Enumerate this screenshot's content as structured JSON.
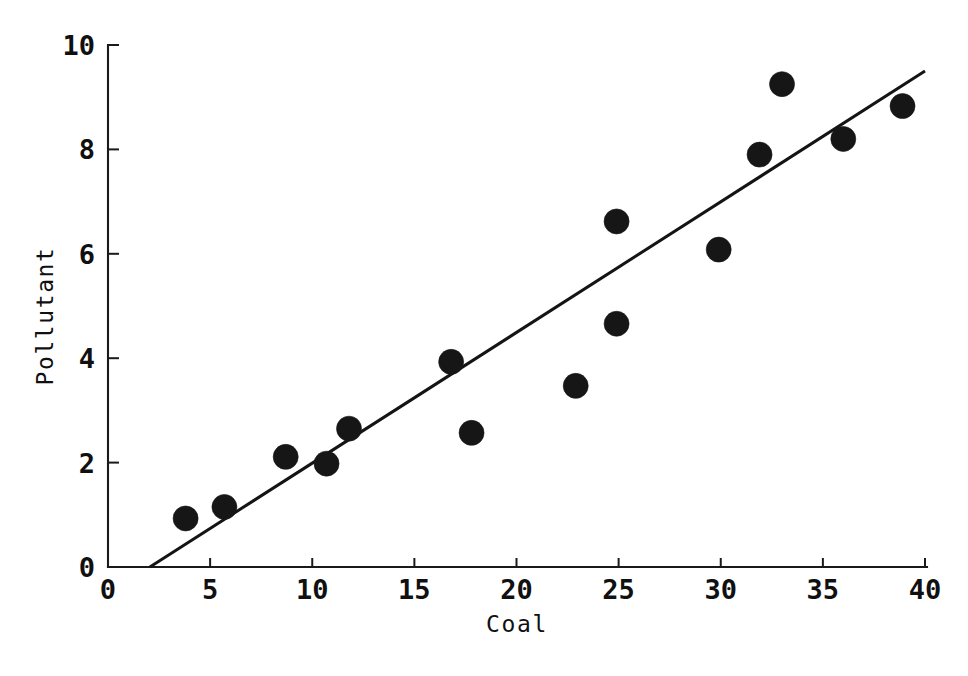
{
  "chart_data": {
    "type": "scatter",
    "title": "",
    "xlabel": "Coal",
    "ylabel": "Pollutant",
    "xlim": [
      0,
      40
    ],
    "ylim": [
      0,
      10
    ],
    "xticks": [
      "0",
      "5",
      "10",
      "15",
      "20",
      "25",
      "30",
      "35",
      "40"
    ],
    "xtick_values": [
      0,
      5,
      10,
      15,
      20,
      25,
      30,
      35,
      40
    ],
    "yticks": [
      "0",
      "2",
      "4",
      "6",
      "8",
      "10"
    ],
    "ytick_values": [
      0,
      2,
      4,
      6,
      8,
      10
    ],
    "grid": false,
    "legend": null,
    "marker": "filled-circle",
    "marker_color": "#161616",
    "x": [
      3.8,
      5.7,
      8.7,
      10.7,
      11.8,
      16.8,
      17.8,
      22.9,
      24.9,
      24.9,
      29.9,
      31.9,
      33.0,
      36.0,
      38.9
    ],
    "y": [
      0.93,
      1.15,
      2.11,
      1.98,
      2.65,
      3.93,
      2.57,
      3.47,
      6.62,
      4.66,
      6.08,
      7.9,
      9.25,
      8.2,
      8.83
    ],
    "points": [
      {
        "x": 3.8,
        "y": 0.93
      },
      {
        "x": 5.7,
        "y": 1.15
      },
      {
        "x": 8.7,
        "y": 2.11
      },
      {
        "x": 10.7,
        "y": 1.98
      },
      {
        "x": 11.8,
        "y": 2.65
      },
      {
        "x": 16.8,
        "y": 3.93
      },
      {
        "x": 17.8,
        "y": 2.57
      },
      {
        "x": 22.9,
        "y": 3.47
      },
      {
        "x": 24.9,
        "y": 6.62
      },
      {
        "x": 24.9,
        "y": 4.66
      },
      {
        "x": 29.9,
        "y": 6.08
      },
      {
        "x": 31.9,
        "y": 7.9
      },
      {
        "x": 33.0,
        "y": 9.25
      },
      {
        "x": 36.0,
        "y": 8.2
      },
      {
        "x": 38.9,
        "y": 8.83
      }
    ],
    "fit_line": {
      "name": "regression-line",
      "x_start": 2.05,
      "y_start": 0.0,
      "x_end": 40.0,
      "y_end": 9.5,
      "color": "#141414"
    },
    "axis_color": "#1a1a1a",
    "background_color": "#ffffff"
  }
}
